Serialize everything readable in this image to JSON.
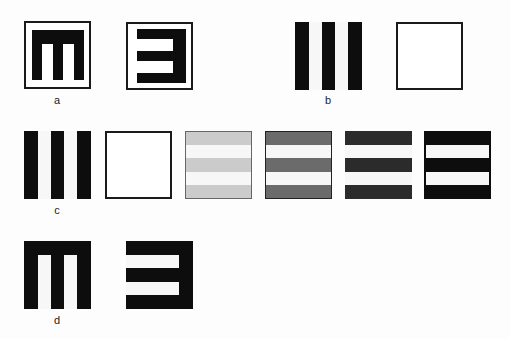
{
  "figure": {
    "labels": {
      "a": "a",
      "b": "b",
      "c": "c",
      "d": "d"
    },
    "colors": {
      "black": "#0d0d0d",
      "white": "#f7f7f7",
      "light_gray": "#cbcbcb",
      "mid_gray": "#6b6b6b",
      "dark_gray": "#2b2b2b"
    },
    "panels": {
      "a": [
        "m-shape-in-frame",
        "e-shape-in-frame"
      ],
      "b": [
        "vertical-grating",
        "blank-frame"
      ],
      "c": [
        "vertical-grating",
        "blank-frame",
        "horizontal-grating-light",
        "horizontal-grating-mid",
        "horizontal-grating-dark",
        "horizontal-grating-black"
      ],
      "d": [
        "m-shape-filled",
        "e-shape-filled"
      ]
    }
  }
}
